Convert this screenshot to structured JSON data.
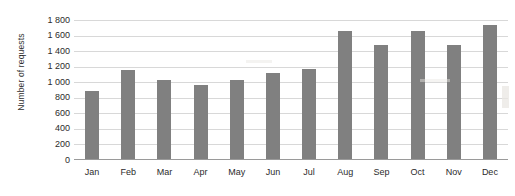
{
  "chart_data": {
    "type": "bar",
    "title": "",
    "xlabel": "",
    "ylabel": "Number of requests",
    "categories": [
      "Jan",
      "Feb",
      "Mar",
      "Apr",
      "May",
      "Jun",
      "Jul",
      "Aug",
      "Sep",
      "Oct",
      "Nov",
      "Dec"
    ],
    "values": [
      870,
      1150,
      1010,
      950,
      1010,
      1100,
      1160,
      1650,
      1470,
      1650,
      1470,
      1720
    ],
    "series": [
      {
        "name": "Number of requests",
        "values": [
          870,
          1150,
          1010,
          950,
          1010,
          1100,
          1160,
          1650,
          1470,
          1650,
          1470,
          1720
        ]
      }
    ],
    "ylim": [
      0,
      1800
    ],
    "ytick_values": [
      0,
      200,
      400,
      600,
      800,
      1000,
      1200,
      1400,
      1600,
      1800
    ],
    "ytick_labels": [
      "0",
      "200",
      "400",
      "600",
      "800",
      "1 000",
      "1 200",
      "1 400",
      "1 600",
      "1 800"
    ],
    "grid": true,
    "grid_axis": "y",
    "legend": false,
    "legend_position": "none",
    "bar_color": "#808080",
    "gridline_color": "#d8d8d8",
    "axis_color": "#9a9a9a",
    "background_color": "#ffffff"
  }
}
